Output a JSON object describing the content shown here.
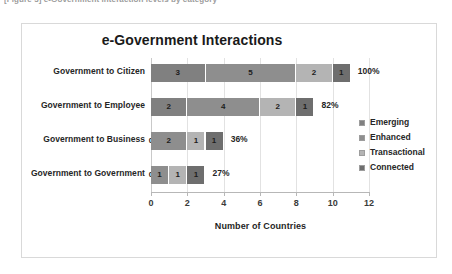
{
  "page": {
    "clipped_caption": "[Figure 3]  e-Government interaction levels by category"
  },
  "chart_frame": {
    "title": "e-Government Interactions"
  },
  "legend": {
    "items": [
      {
        "label": "Emerging",
        "color": "#808080"
      },
      {
        "label": "Enhanced",
        "color": "#8e8e8e"
      },
      {
        "label": "Transactional",
        "color": "#b4b4b4"
      },
      {
        "label": "Connected",
        "color": "#6e6e6e"
      }
    ]
  },
  "axis": {
    "x_title": "Number of Countries",
    "ticks": [
      "0",
      "2",
      "4",
      "6",
      "8",
      "10",
      "12"
    ]
  },
  "rows": [
    {
      "category": "Government to Citizen",
      "values": [
        "3",
        "5",
        "2",
        "1"
      ],
      "percent": "100%"
    },
    {
      "category": "Government to Employee",
      "values": [
        "2",
        "4",
        "2",
        "1"
      ],
      "percent": "82%"
    },
    {
      "category": "Government to Business",
      "values": [
        "0",
        "2",
        "1",
        "1"
      ],
      "percent": "36%"
    },
    {
      "category": "Government to Government",
      "values": [
        "0",
        "1",
        "1",
        "1"
      ],
      "percent": "27%"
    }
  ],
  "chart_data": {
    "type": "bar",
    "orientation": "horizontal",
    "stacked": true,
    "title": "e-Government Interactions",
    "xlabel": "Number of Countries",
    "ylabel": "",
    "xlim": [
      0,
      12
    ],
    "xticks": [
      0,
      2,
      4,
      6,
      8,
      10,
      12
    ],
    "grid": true,
    "legend_position": "right",
    "categories": [
      "Government to Citizen",
      "Government to Employee",
      "Government to Business",
      "Government to Government"
    ],
    "series": [
      {
        "name": "Emerging",
        "values": [
          3,
          2,
          0,
          0
        ],
        "color": "#808080"
      },
      {
        "name": "Enhanced",
        "values": [
          5,
          4,
          2,
          1
        ],
        "color": "#8e8e8e"
      },
      {
        "name": "Transactional",
        "values": [
          2,
          2,
          1,
          1
        ],
        "color": "#b4b4b4"
      },
      {
        "name": "Connected",
        "values": [
          1,
          1,
          1,
          1
        ],
        "color": "#6e6e6e"
      }
    ],
    "totals": [
      11,
      9,
      4,
      3
    ],
    "annotations": [
      {
        "category": "Government to Citizen",
        "text": "100%"
      },
      {
        "category": "Government to Employee",
        "text": "82%"
      },
      {
        "category": "Government to Business",
        "text": "36%"
      },
      {
        "category": "Government to Government",
        "text": "27%"
      }
    ]
  }
}
